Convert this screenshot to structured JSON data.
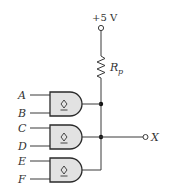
{
  "supply": {
    "label": "+5 V"
  },
  "resistor": {
    "label": "R",
    "subscript": "p"
  },
  "inputs": [
    "A",
    "B",
    "C",
    "D",
    "E",
    "F"
  ],
  "output": {
    "label": "X"
  },
  "gates": [
    {
      "type": "AND",
      "marker": "open-collector",
      "inputs": [
        "A",
        "B"
      ]
    },
    {
      "type": "AND",
      "marker": "open-collector",
      "inputs": [
        "C",
        "D"
      ]
    },
    {
      "type": "AND",
      "marker": "open-collector",
      "inputs": [
        "E",
        "F"
      ]
    }
  ],
  "colors": {
    "gate_fill": "#e2e2e2",
    "line": "#3a3a3a",
    "text": "#333333"
  }
}
